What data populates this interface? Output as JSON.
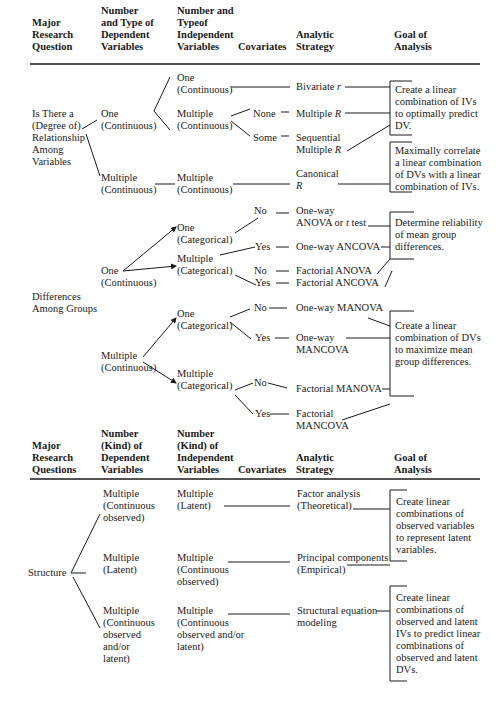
{
  "table1": {
    "headers": {
      "question": "Major\nResearch\nQuestion",
      "dv": "Number\nand Type of\nDependent\nVariables",
      "iv": "Number and\nTypeof\nIndependent\nVariables",
      "covariates": "Covariates",
      "strategy": "Analytic\nStrategy",
      "goal": "Goal of\nAnalysis"
    },
    "relationship": {
      "question": "Is There a\n(Degree of)\nRelationship\nAmong\nVariables",
      "dv_one": "One\n(Continuous)",
      "dv_multiple": "Multiple\n(Continuous)",
      "iv_one": "One\n(Continuous)",
      "iv_multiple": "Multiple\n(Continuous)",
      "iv_multiple2": "Multiple\n(Continuous)",
      "cov_none": "None",
      "cov_some": "Some",
      "strat_bivariate": "Bivariate ",
      "strat_bivariate_sym": "r",
      "strat_multiple": "Multiple ",
      "strat_multiple_sym": "R",
      "strat_sequential": "Sequential\nMultiple ",
      "strat_sequential_sym": "R",
      "strat_canonical": "Canonical",
      "strat_canonical_sym": "R",
      "goal_predict": "Create a linear\ncombination of IVs\nto optimally predict\nDV.",
      "goal_correlate": "Maximally correlate\na linear combination\nof DVs with a linear\ncombination of IVs."
    },
    "differences": {
      "question": "Differences\nAmong Groups",
      "dv_one": "One\n(Continuous)",
      "dv_multiple": "Multiple\n(Continuous)",
      "iv_one_cat_a": "One\n(Categorical)",
      "iv_multi_cat_a": "Multiple\n(Categorical)",
      "iv_one_cat_b": "One\n(Categorical)",
      "iv_multi_cat_b": "Multiple\n(Categorical)",
      "cov_no": "No",
      "cov_yes": "Yes",
      "strat_oneway_anova": "One-way\nANOVA or ",
      "strat_oneway_anova_sym": "t",
      "strat_oneway_anova_tail": " test",
      "strat_oneway_ancova": "One-way ANCOVA",
      "strat_factorial_anova": "Factorial ANOVA",
      "strat_factorial_ancova": "Factorial ANCOVA",
      "strat_oneway_manova": "One-way MANOVA",
      "strat_oneway_mancova": "One-way\nMANCOVA",
      "strat_factorial_manova": "Factorial MANOVA",
      "strat_factorial_mancova": "Factorial\nMANCOVA",
      "goal_reliability": "Determine reliability\nof mean group\ndifferences.",
      "goal_maximize": "Create a linear\ncombination of DVs\nto maximize mean\ngroup differences."
    }
  },
  "table2": {
    "headers": {
      "question": "Major\nResearch\nQuestions",
      "dv": "Number\n(Kind) of\nDependent\nVariables",
      "iv": "Number\n(Kind) of\nIndependent\nVariables",
      "covariates": "Covariates",
      "strategy": "Analytic\nStrategy",
      "goal": "Goal of\nAnalysis"
    },
    "structure": {
      "question": "Structure",
      "dv_1": "Multiple\n(Continuous\nobserved)",
      "dv_2": "Multiple\n(Latent)",
      "dv_3": "Multiple\n(Continuous\nobserved\nand/or\nlatent)",
      "iv_1": "Multiple\n(Latent)",
      "iv_2": "Multiple\n(Continuous\nobserved)",
      "iv_3": "Multiple\n(Continuous\nobserved and/or\nlatent)",
      "strat_factor": "Factor analysis\n(Theoretical)",
      "strat_pca": "Principal components\n(Empirical)",
      "strat_sem": "Structural equation\nmodeling",
      "goal_latent": "Create linear\ncombinations of\nobserved variables\nto represent latent\nvariables.",
      "goal_sem": "Create linear\ncombinations of\nobserved and latent\nIVs to predict linear\ncombinations of\nobserved and latent\nDVs."
    }
  }
}
